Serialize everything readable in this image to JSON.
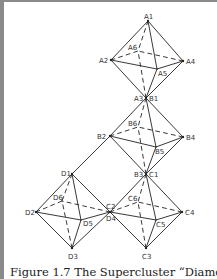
{
  "figure": {
    "caption": "Figure 1.7 The Supercluster “Diamond",
    "line_color": "#222222",
    "background": "#ffffff"
  },
  "labels": {
    "A1": "A1",
    "A2": "A2",
    "A3": "A3",
    "A4": "A4",
    "A5": "A5",
    "A6": "A6",
    "B1": "B1",
    "B2": "B2",
    "B3": "B3",
    "B4": "B4",
    "B5": "B5",
    "B6": "B6",
    "C1": "C1",
    "C2": "C2",
    "C3": "C3",
    "C4": "C4",
    "C5": "C5",
    "C6": "C6",
    "D1": "D1",
    "D2": "D2",
    "D3": "D3",
    "D4": "D4",
    "D5": "D5",
    "D6": "D6"
  },
  "octahedra": [
    {
      "name": "A",
      "top": "A1",
      "left": "A2",
      "bottom": "A3",
      "right": "A4",
      "front": "A5",
      "back": "A6"
    },
    {
      "name": "B",
      "top": "B1",
      "left": "B2",
      "bottom": "B3",
      "right": "B4",
      "front": "B5",
      "back": "B6"
    },
    {
      "name": "C",
      "top": "C1",
      "left": "C2",
      "bottom": "C3",
      "right": "C4",
      "front": "C5",
      "back": "C6"
    },
    {
      "name": "D",
      "top": "D1",
      "left": "D2",
      "bottom": "D3",
      "right": "D4",
      "front": "D5",
      "back": "D6"
    }
  ],
  "shared_vertices": [
    [
      "A3",
      "B1"
    ],
    [
      "B3",
      "C1"
    ],
    [
      "C2",
      "D4"
    ]
  ],
  "connector": [
    "B2",
    "D1"
  ]
}
